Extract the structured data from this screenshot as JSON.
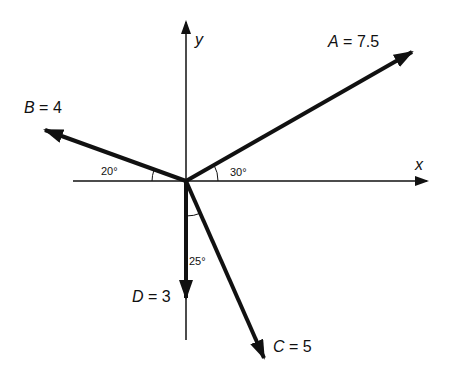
{
  "diagram": {
    "title": "",
    "origin": {
      "x": 186,
      "y": 181
    },
    "axes": {
      "x_label": "x",
      "y_label": "y"
    },
    "vectors": [
      {
        "name": "A",
        "label": "A = 7.5",
        "magnitude": 7.5,
        "angle_label": "30°",
        "direction": "30° above +x axis"
      },
      {
        "name": "B",
        "label": "B = 4",
        "magnitude": 4,
        "angle_label": "20°",
        "direction": "20° above −x axis"
      },
      {
        "name": "C",
        "label": "C = 5",
        "magnitude": 5,
        "angle_label": "25°",
        "direction": "25° from −y axis toward +x"
      },
      {
        "name": "D",
        "label": "D = 3",
        "magnitude": 3,
        "angle_label": "",
        "direction": "along −y axis"
      }
    ],
    "colors": {
      "ink": "#111111",
      "background": "#ffffff"
    }
  }
}
